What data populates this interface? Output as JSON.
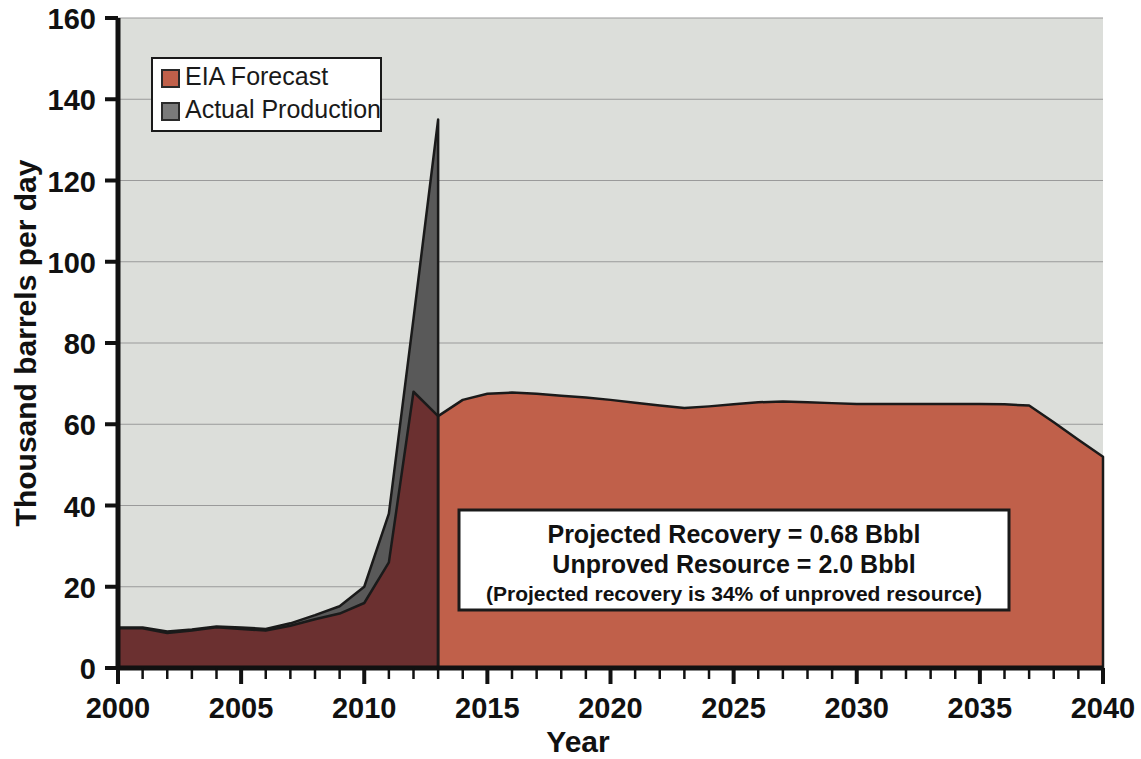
{
  "chart_data": {
    "type": "area",
    "title": "",
    "xlabel": "Year",
    "ylabel": "Thousand barrels per day",
    "xlim": [
      2000,
      2040
    ],
    "ylim": [
      0,
      160
    ],
    "ytick_step": 20,
    "xtick_step": 5,
    "xminor_step": 1,
    "grid": "horizontal",
    "legend_position": "top-left",
    "x": [
      2000,
      2001,
      2002,
      2003,
      2004,
      2005,
      2006,
      2007,
      2008,
      2009,
      2010,
      2011,
      2012,
      2013,
      2014,
      2015,
      2016,
      2017,
      2018,
      2019,
      2020,
      2021,
      2022,
      2023,
      2024,
      2025,
      2026,
      2027,
      2028,
      2029,
      2030,
      2031,
      2032,
      2033,
      2034,
      2035,
      2036,
      2037,
      2038,
      2039,
      2040
    ],
    "series": [
      {
        "name": "EIA Forecast",
        "color": "#C0604A",
        "overlap_color": "#6B3030",
        "values": [
          9.8,
          9.8,
          8.6,
          9.2,
          10.0,
          9.6,
          9.2,
          10.4,
          12.0,
          13.4,
          16.0,
          26.0,
          68.0,
          62.0,
          66.0,
          67.5,
          67.8,
          67.5,
          67.0,
          66.6,
          66.0,
          65.3,
          64.6,
          64.0,
          64.4,
          64.9,
          65.4,
          65.6,
          65.4,
          65.2,
          65.0,
          65.0,
          65.0,
          65.0,
          65.0,
          65.0,
          64.9,
          64.6,
          60.5,
          56.2,
          52.0
        ]
      },
      {
        "name": "Actual Production",
        "color": "#595959",
        "values": [
          10.0,
          10.0,
          9.0,
          9.5,
          10.2,
          10.0,
          9.6,
          11.0,
          13.0,
          15.2,
          20.0,
          38.0,
          86.0,
          135.0,
          null,
          null,
          null,
          null,
          null,
          null,
          null,
          null,
          null,
          null,
          null,
          null,
          null,
          null,
          null,
          null,
          null,
          null,
          null,
          null,
          null,
          null,
          null,
          null,
          null,
          null,
          null
        ]
      }
    ],
    "forecast_start_year": 2013,
    "ytick_labels": [
      "0",
      "20",
      "40",
      "60",
      "80",
      "100",
      "120",
      "140",
      "160"
    ],
    "xtick_labels": [
      "2000",
      "2005",
      "2010",
      "2015",
      "2020",
      "2025",
      "2030",
      "2035",
      "2040"
    ],
    "plot_background": "#DCDEDA",
    "gridline_color": "#9a9a9a",
    "axis_color": "#111111"
  },
  "legend": {
    "items": [
      {
        "label": "EIA Forecast",
        "swatch": "#C0604A"
      },
      {
        "label": "Actual Production",
        "swatch": "#7A7A7A"
      }
    ]
  },
  "annotation": {
    "line1": "Projected Recovery = 0.68 Bbbl",
    "line2": "Unproved Resource = 2.0 Bbbl",
    "line3": "(Projected recovery is 34% of unproved resource)"
  },
  "axes": {
    "x_title": "Year",
    "y_title": "Thousand barrels per day"
  }
}
